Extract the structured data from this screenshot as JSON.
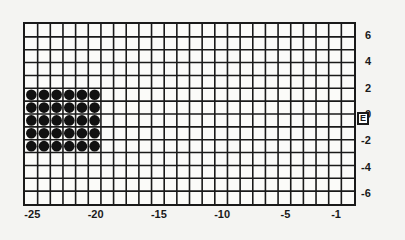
{
  "chart_data": {
    "type": "grid",
    "title": "",
    "grid": {
      "columns": 26,
      "rows": 14
    },
    "x_axis": {
      "range": [
        -26,
        -1
      ],
      "tick_labels": [
        "-25",
        "-20",
        "-15",
        "-10",
        "-5",
        "-1"
      ],
      "tick_values": [
        -25,
        -20,
        -15,
        -10,
        -5,
        -1
      ]
    },
    "y_axis": {
      "position": "right",
      "range": [
        -7,
        7
      ],
      "tick_labels": [
        "6",
        "4",
        "2",
        "0",
        "-2",
        "-4",
        "-6"
      ],
      "tick_values": [
        6,
        4,
        2,
        0,
        -2,
        -4,
        -6
      ]
    },
    "filled_block": {
      "col_start": 0,
      "col_count": 6,
      "row_start": 5,
      "row_count": 5,
      "marker": "filled-circle",
      "color": "#111111"
    },
    "edge_marker": {
      "label": "E",
      "y": 0,
      "side": "right"
    }
  },
  "colors": {
    "line": "#1a1a1a",
    "background": "#fbfbf9",
    "dot": "#111111"
  }
}
